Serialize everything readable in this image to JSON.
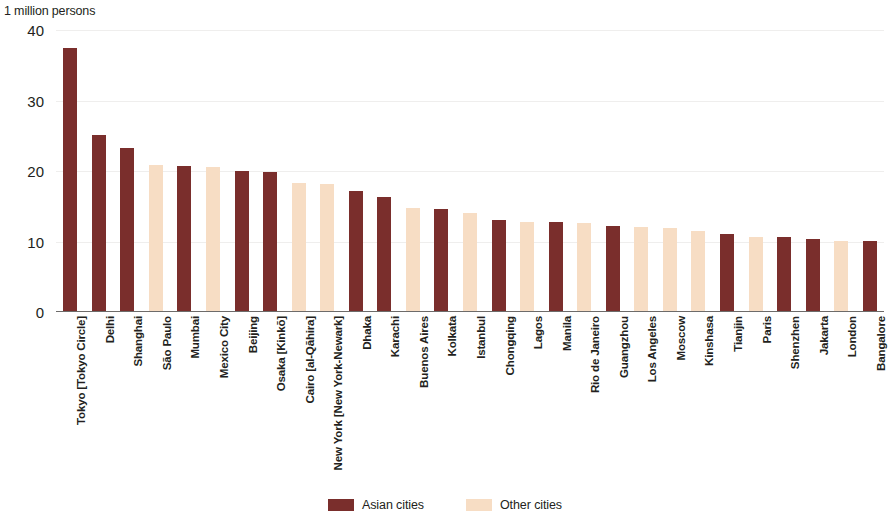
{
  "chart_data": {
    "type": "bar",
    "title": "",
    "subtitle": "",
    "unit_caption": "1 million persons",
    "xlabel": "",
    "ylabel": "1 million persons",
    "ylim": [
      0,
      40
    ],
    "yticks": [
      0,
      10,
      20,
      30,
      40
    ],
    "ytick_labels": [
      "0",
      "10",
      "20",
      "30",
      "40"
    ],
    "grid": true,
    "legend_position": "bottom-center",
    "categories": [
      "Tokyo [Tokyo Circle]",
      "Delhi",
      "Shanghai",
      "São Paulo",
      "Mumbai",
      "Mexico City",
      "Beijing",
      "Osaka [Kinkō]",
      "Cairo [al-Qāhira]",
      "New York [New York-Newark]",
      "Dhaka",
      "Karachi",
      "Buenos Aires",
      "Kolkata",
      "Istanbul",
      "Chongqing",
      "Lagos",
      "Manila",
      "Rio de Janeiro",
      "Guangzhou",
      "Los Angeles",
      "Moscow",
      "Kinshasa",
      "Tianjin",
      "Paris",
      "Shenzhen",
      "Jakarta",
      "London",
      "Bangalore"
    ],
    "values": [
      37.2,
      24.9,
      23.0,
      20.6,
      20.5,
      20.4,
      19.8,
      19.6,
      18.1,
      18.0,
      17.0,
      16.1,
      14.6,
      14.4,
      13.8,
      12.9,
      12.6,
      12.5,
      12.4,
      12.0,
      11.8,
      11.7,
      11.3,
      10.8,
      10.4,
      10.4,
      10.1,
      9.9,
      9.8
    ],
    "bar_groups": [
      "asian",
      "asian",
      "asian",
      "other",
      "asian",
      "other",
      "asian",
      "asian",
      "other",
      "other",
      "asian",
      "asian",
      "other",
      "asian",
      "other",
      "asian",
      "other",
      "asian",
      "other",
      "asian",
      "other",
      "other",
      "other",
      "asian",
      "other",
      "asian",
      "asian",
      "other",
      "asian"
    ],
    "series": [
      {
        "name": "Asian cities",
        "color": "#7a2e2c"
      },
      {
        "name": "Other cities",
        "color": "#f7ddc4"
      }
    ],
    "legend": [
      {
        "label": "Asian cities",
        "group": "asian",
        "color": "#7a2e2c"
      },
      {
        "label": "Other cities",
        "group": "other",
        "color": "#f7ddc4"
      }
    ]
  }
}
